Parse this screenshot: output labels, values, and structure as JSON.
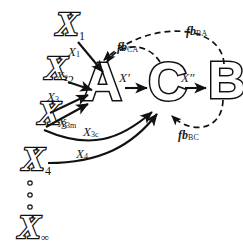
{
  "diagram": {
    "stroke_color": "#111111",
    "background": "#ffffff",
    "inputs": [
      {
        "name": "x-input-1",
        "base": "X",
        "sub": "1"
      },
      {
        "name": "x-input-2",
        "base": "X",
        "sub": "2"
      },
      {
        "name": "x-input-3",
        "base": "X",
        "sub": "3"
      },
      {
        "name": "x-input-4",
        "base": "X",
        "sub": "4"
      },
      {
        "name": "x-input-inf",
        "base": "X",
        "sub": "∞"
      }
    ],
    "vertical_dots": "···",
    "blocks": [
      {
        "name": "block-a",
        "label": "A"
      },
      {
        "name": "block-c",
        "label": "C"
      },
      {
        "name": "block-b",
        "label": "B"
      }
    ],
    "edge_labels": [
      {
        "name": "edge-label-x1",
        "base": "X",
        "sub": "1"
      },
      {
        "name": "edge-label-x2",
        "base": "X",
        "sub": "2"
      },
      {
        "name": "edge-label-x3",
        "base": "X",
        "sub": "3"
      },
      {
        "name": "edge-label-x3m",
        "base": "X",
        "sub": "3m"
      },
      {
        "name": "edge-label-x3c",
        "base": "X",
        "sub": "3c"
      },
      {
        "name": "edge-label-x4",
        "base": "X",
        "sub": "4"
      },
      {
        "name": "edge-label-x-prime",
        "base": "X′",
        "sub": ""
      },
      {
        "name": "edge-label-x-dprime",
        "base": "X″",
        "sub": ""
      }
    ],
    "feedback_labels": [
      {
        "name": "feedback-label-fbba",
        "fb": "fb",
        "sub": "BA"
      },
      {
        "name": "feedback-label-fbca",
        "fb": "fb",
        "sub": "CA"
      },
      {
        "name": "feedback-label-fbbc",
        "fb": "fb",
        "sub": "BC"
      }
    ]
  }
}
